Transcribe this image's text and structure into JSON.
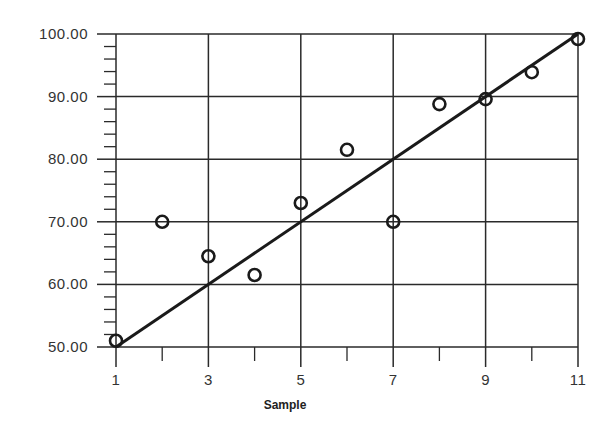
{
  "chart_data": {
    "type": "scatter",
    "title": "",
    "xlabel": "Sample",
    "ylabel": "",
    "xlim": [
      1,
      11
    ],
    "ylim": [
      50,
      100
    ],
    "grid": true,
    "legend": null,
    "x_ticks": [
      1,
      3,
      5,
      7,
      9,
      11
    ],
    "x_tick_labels": [
      "1",
      "3",
      "5",
      "7",
      "9",
      "11"
    ],
    "x_minor_ticks": [
      2,
      4,
      6,
      8,
      10
    ],
    "y_ticks": [
      50,
      60,
      70,
      80,
      90,
      100
    ],
    "y_tick_labels": [
      "50.00",
      "60.00",
      "70.00",
      "80.00",
      "90.00",
      "100.00"
    ],
    "y_minor_step": 2,
    "series": [
      {
        "name": "Observed",
        "type": "scatter",
        "marker": "open-circle",
        "x": [
          1,
          2,
          3,
          4,
          5,
          6,
          7,
          8,
          9,
          10,
          11
        ],
        "y": [
          51.0,
          70.0,
          64.5,
          61.5,
          73.0,
          81.5,
          70.0,
          88.8,
          89.6,
          93.9,
          99.2
        ]
      },
      {
        "name": "Trend line",
        "type": "line",
        "x": [
          1,
          11
        ],
        "y": [
          50,
          100
        ]
      }
    ]
  },
  "colors": {
    "line": "#1a1a1a",
    "grid": "#2a2a2a",
    "text": "#333333",
    "background": "#ffffff"
  }
}
